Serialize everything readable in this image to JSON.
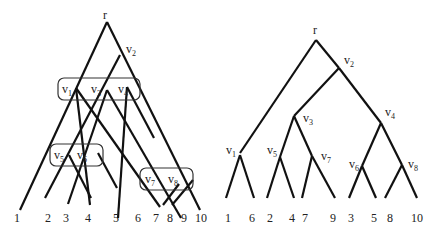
{
  "left_diagram": {
    "root_label": "r",
    "node_labels": {
      "v1": {
        "base": "v",
        "sub": "1"
      },
      "v2": {
        "base": "v",
        "sub": "2"
      },
      "v3": {
        "base": "v",
        "sub": "3"
      },
      "v4": {
        "base": "v",
        "sub": "4"
      },
      "v5": {
        "base": "v",
        "sub": "5"
      },
      "v6": {
        "base": "v",
        "sub": "6"
      },
      "v7": {
        "base": "v",
        "sub": "7"
      },
      "v8": {
        "base": "v",
        "sub": "8"
      }
    },
    "groups": [
      [
        "v1",
        "v3",
        "v4"
      ],
      [
        "v5",
        "v6"
      ],
      [
        "v7",
        "v8"
      ]
    ],
    "leaves": [
      "1",
      "2",
      "3",
      "4",
      "5",
      "6",
      "7",
      "8",
      "9",
      "10"
    ]
  },
  "right_diagram": {
    "root_label": "r",
    "node_labels": {
      "v1": {
        "base": "v",
        "sub": "1"
      },
      "v2": {
        "base": "v",
        "sub": "2"
      },
      "v3": {
        "base": "v",
        "sub": "3"
      },
      "v4": {
        "base": "v",
        "sub": "4"
      },
      "v5": {
        "base": "v",
        "sub": "5"
      },
      "v6": {
        "base": "v",
        "sub": "6"
      },
      "v7": {
        "base": "v",
        "sub": "7"
      },
      "v8": {
        "base": "v",
        "sub": "8"
      }
    },
    "structure": {
      "r": [
        "v1",
        "v2"
      ],
      "v2": [
        "v3",
        "v4"
      ],
      "v1": [
        "1",
        "6"
      ],
      "v3": [
        "v5",
        "v7"
      ],
      "v5": [
        "2",
        "4"
      ],
      "v7": [
        "7",
        "9"
      ],
      "v4": [
        "v6",
        "v8"
      ],
      "v6": [
        "3",
        "5"
      ],
      "v8": [
        "8",
        "10"
      ]
    },
    "leaves": [
      "1",
      "6",
      "2",
      "4",
      "7",
      "9",
      "3",
      "5",
      "8",
      "10"
    ]
  }
}
